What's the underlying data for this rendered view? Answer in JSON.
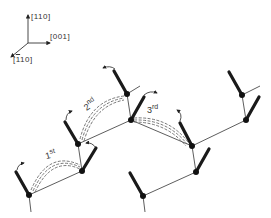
{
  "axes": {
    "up_label": "[110]",
    "right_label": "[001]",
    "diag_label_bar": "1",
    "diag_label_rest": "10",
    "diag_label_open": "[",
    "diag_label_close": "]"
  },
  "jumps": [
    {
      "num": "1",
      "suffix": "st"
    },
    {
      "num": "2",
      "suffix": "nd"
    },
    {
      "num": "3",
      "suffix": "rd"
    }
  ],
  "colors": {
    "ink": "#1a1a1a",
    "line": "#333333",
    "dash": "#555555",
    "background": "#ffffff"
  }
}
